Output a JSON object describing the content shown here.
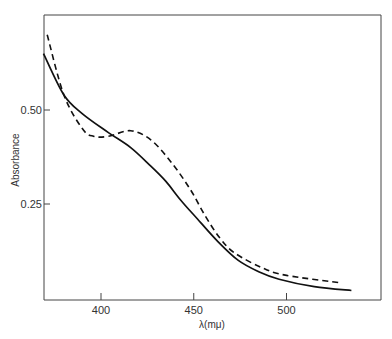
{
  "chart_data": {
    "type": "line",
    "title": "",
    "xlabel": "λ(mμ)",
    "ylabel": "Absorbance",
    "xlim": [
      369,
      550
    ],
    "ylim": [
      0,
      0.74
    ],
    "x_ticks": [
      400,
      450,
      500
    ],
    "x_tick_labels": [
      "400",
      "450",
      "500"
    ],
    "y_ticks": [
      0.25,
      0.5
    ],
    "y_tick_labels": [
      "0.25",
      "0.50"
    ],
    "grid": false,
    "legend": null,
    "series": [
      {
        "name": "solid",
        "style": "solid",
        "x": [
          369,
          380,
          390,
          404,
          416,
          427,
          435,
          443,
          452,
          463,
          474,
          485,
          496,
          515,
          535
        ],
        "y": [
          0.65,
          0.54,
          0.49,
          0.44,
          0.4,
          0.35,
          0.31,
          0.26,
          0.21,
          0.15,
          0.1,
          0.07,
          0.05,
          0.03,
          0.02
        ]
      },
      {
        "name": "dashed",
        "style": "dashed",
        "x": [
          371,
          380,
          390,
          396,
          404,
          416,
          427,
          438,
          448,
          456,
          464,
          472,
          487,
          500,
          530
        ],
        "y": [
          0.7,
          0.54,
          0.45,
          0.43,
          0.43,
          0.445,
          0.42,
          0.36,
          0.29,
          0.22,
          0.16,
          0.12,
          0.08,
          0.06,
          0.04
        ]
      }
    ]
  },
  "axes": {
    "xlabel": "λ(mμ)",
    "ylabel": "Absorbance",
    "x_ticks": [
      "400",
      "450",
      "500"
    ],
    "y_ticks": [
      "0.25",
      "0.50"
    ]
  }
}
